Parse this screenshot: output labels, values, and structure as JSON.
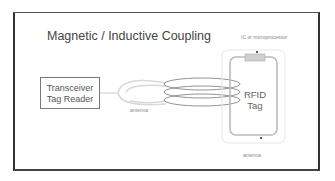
{
  "title": "Magnetic / Inductive Coupling",
  "reader": {
    "line1": "Transceiver",
    "line2": "Tag Reader"
  },
  "reader_antenna_label": "antenna",
  "tag": {
    "line1": "RFID",
    "line2": "Tag",
    "chip_label": "IC or microprocessor",
    "antenna_label": "antenna"
  },
  "colors": {
    "frame": "#333333",
    "coil": "#777777",
    "faint_coil": "#d8d8d8",
    "chip": "#cccccc"
  }
}
